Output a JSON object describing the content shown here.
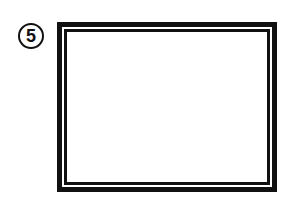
{
  "step": {
    "number": "5"
  },
  "frame": {
    "description": "double-line rectangular frame",
    "border_color": "#111111",
    "fill_color": "#ffffff"
  }
}
